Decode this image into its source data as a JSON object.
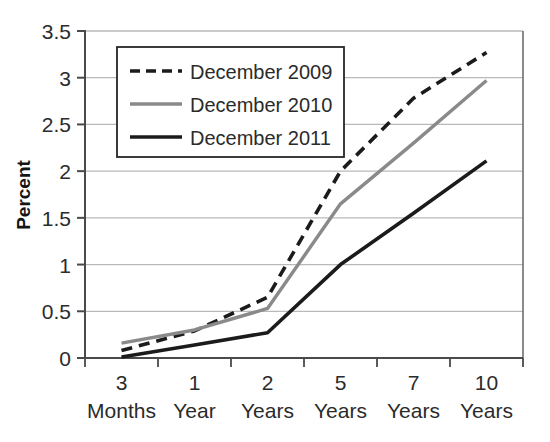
{
  "chart_data": {
    "type": "line",
    "title": "",
    "xlabel": "",
    "ylabel": "Percent",
    "ylim": [
      0,
      3.5
    ],
    "yticks": [
      "0",
      "0.5",
      "1",
      "1.5",
      "2",
      "2.5",
      "3",
      "3.5"
    ],
    "ytick_values": [
      0,
      0.5,
      1,
      1.5,
      2,
      2.5,
      3,
      3.5
    ],
    "grid": true,
    "grid_axis": "y",
    "legend_position": "upper-left-inside",
    "categories": [
      "3 Months",
      "1 Year",
      "2 Years",
      "5 Years",
      "7 Years",
      "10 Years"
    ],
    "category_lines": [
      {
        "top": "3",
        "bottom": "Months"
      },
      {
        "top": "1",
        "bottom": "Year"
      },
      {
        "top": "2",
        "bottom": "Years"
      },
      {
        "top": "5",
        "bottom": "Years"
      },
      {
        "top": "7",
        "bottom": "Years"
      },
      {
        "top": "10",
        "bottom": "Years"
      }
    ],
    "series": [
      {
        "name": "December 2009",
        "values": [
          0.08,
          0.29,
          0.65,
          2.0,
          2.78,
          3.27
        ],
        "color": "#1b1b1b",
        "style": "dashed",
        "width": 3.6
      },
      {
        "name": "December 2010",
        "values": [
          0.16,
          0.3,
          0.53,
          1.65,
          2.3,
          2.97
        ],
        "color": "#8a8a8a",
        "style": "solid",
        "width": 3.4
      },
      {
        "name": "December 2011",
        "values": [
          0.01,
          0.14,
          0.27,
          1.0,
          1.55,
          2.11
        ],
        "color": "#1b1b1b",
        "style": "solid",
        "width": 3.6
      }
    ]
  },
  "colors": {
    "axis": "#4a4a4a",
    "grid": "#b9b9b9",
    "text": "#2b2b2b",
    "series_2009": "#1b1b1b",
    "series_2010": "#8a8a8a",
    "series_2011": "#1b1b1b",
    "background": "#ffffff",
    "legend_border": "#262626"
  },
  "legend": {
    "items": [
      {
        "label": "December 2009",
        "style": "dashed",
        "color": "#1b1b1b"
      },
      {
        "label": "December 2010",
        "style": "solid",
        "color": "#8a8a8a"
      },
      {
        "label": "December 2011",
        "style": "solid",
        "color": "#1b1b1b"
      }
    ]
  }
}
